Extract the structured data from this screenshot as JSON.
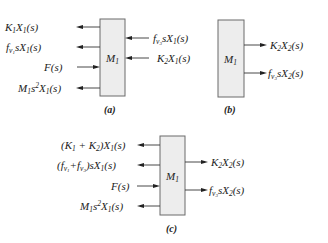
{
  "panels": [
    {
      "id": "a",
      "caption": "(a)",
      "block": "M1",
      "left_labels": [
        {
          "text": "K1X1(s)",
          "direction": "out"
        },
        {
          "text": "fv1sX1(s)",
          "direction": "out"
        },
        {
          "text": "F(s)",
          "direction": "in"
        },
        {
          "text": "M1s^2X1(s)",
          "direction": "out"
        }
      ],
      "right_labels": [
        {
          "text": "fv3sX1(s)",
          "direction": "in"
        },
        {
          "text": "K2X1(s)",
          "direction": "in"
        }
      ]
    },
    {
      "id": "b",
      "caption": "(b)",
      "block": "M1",
      "left_labels": [],
      "right_labels": [
        {
          "text": "K2X2(s)",
          "direction": "out"
        },
        {
          "text": "fv3sX2(s)",
          "direction": "out"
        }
      ]
    },
    {
      "id": "c",
      "caption": "(c)",
      "block": "M1",
      "left_labels": [
        {
          "text": "(K1 + K2)X1(s)",
          "direction": "out"
        },
        {
          "text": "(fv1 + fv3)sX1(s)",
          "direction": "out"
        },
        {
          "text": "F(s)",
          "direction": "in"
        },
        {
          "text": "M1s^2X1(s)",
          "direction": "out"
        }
      ],
      "right_labels": [
        {
          "text": "K2X2(s)",
          "direction": "out"
        },
        {
          "text": "fv3sX2(s)",
          "direction": "out"
        }
      ]
    }
  ],
  "colors": {
    "box_fill": "#ededed",
    "box_stroke": "#6a6a6a",
    "ink": "#222222"
  }
}
